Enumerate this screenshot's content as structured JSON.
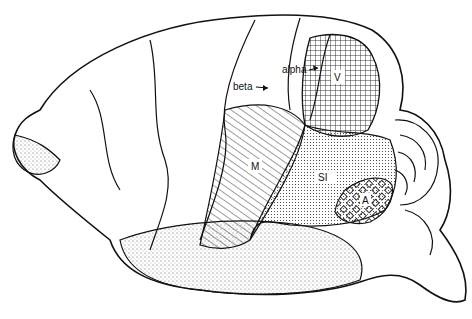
{
  "figure": {
    "type": "brain-lateral-view-line-drawing",
    "labels": {
      "alpha": "alpha",
      "beta": "beta",
      "V": "V",
      "M": "M",
      "SI": "SI",
      "A": "A"
    },
    "regions": [
      {
        "id": "V",
        "pattern": "crosshatch-grid"
      },
      {
        "id": "M",
        "pattern": "diagonal-lines"
      },
      {
        "id": "SI",
        "pattern": "fine-dots"
      },
      {
        "id": "A",
        "pattern": "open-diamonds"
      }
    ],
    "arrows": [
      "alpha",
      "beta"
    ]
  }
}
